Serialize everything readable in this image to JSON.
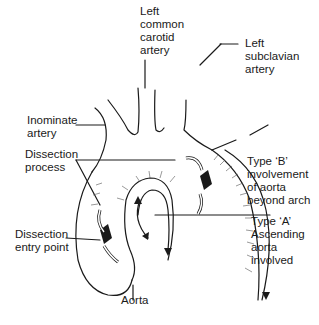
{
  "diagram": {
    "labels": {
      "left_common_carotid": [
        "Left",
        "common",
        "carotid",
        "artery"
      ],
      "left_subclavian": [
        "Left",
        "subclavian",
        "artery"
      ],
      "inominate": [
        "Inominate",
        "artery"
      ],
      "dissection_process": [
        "Dissection",
        "process"
      ],
      "type_b": [
        "Type ‘B’",
        "involvement",
        "of aorta",
        "beyond arch"
      ],
      "type_a": [
        "Type ‘A’",
        "Ascending",
        "aorta",
        "involved"
      ],
      "dissection_entry": [
        "Dissection",
        "entry point"
      ],
      "aorta": [
        "Aorta"
      ]
    },
    "colors": {
      "ink": "#1a1a1a",
      "background": "#ffffff"
    }
  }
}
